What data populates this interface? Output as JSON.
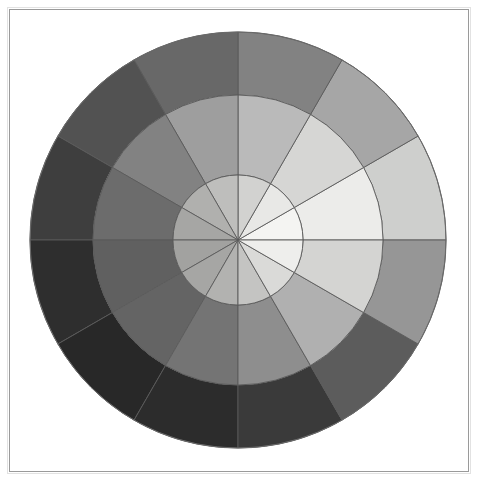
{
  "page": {
    "background_color": "#ffffff"
  },
  "frame": {
    "name": "picture-frame",
    "border_color": "#9a9a9a",
    "outer_border_color": "#e2e2e2",
    "inset_px": 9
  },
  "chart_data": {
    "type": "pie",
    "subtitle": "12 hue sectors × 3 concentric value rings",
    "xlabel": "",
    "ylabel": "",
    "legend_position": "none",
    "grid": false,
    "center": {
      "x": 238,
      "y": 240
    },
    "sector_count": 12,
    "sector_angle_degrees": 30,
    "start_angle_degrees": 0,
    "ring_count": 3,
    "ring_names": [
      "inner",
      "middle",
      "outer"
    ],
    "radii": {
      "inner": 65,
      "middle": 145,
      "outer": 208
    },
    "stroke_color": "#5a5a5a",
    "categories": [
      "0°–30°",
      "30°–60°",
      "60°–90°",
      "90°–120°",
      "120°–150°",
      "150°–180°",
      "180°–210°",
      "210°–240°",
      "240°–270°",
      "270°–300°",
      "300°–330°",
      "330°–360°"
    ],
    "series": [
      {
        "name": "inner",
        "values": [
          244,
          232,
          210,
          190,
          176,
          166,
          162,
          166,
          178,
          196,
          218,
          238
        ],
        "colors": [
          "#f4f4f2",
          "#e8e8e6",
          "#d2d2d0",
          "#bebebc",
          "#b0b0ae",
          "#a6a6a4",
          "#a2a2a0",
          "#a6a6a4",
          "#b2b2b0",
          "#c4c4c2",
          "#dadad8",
          "#eeeeec"
        ]
      },
      {
        "name": "middle",
        "values": [
          236,
          214,
          186,
          158,
          130,
          108,
          96,
          100,
          116,
          142,
          176,
          212
        ],
        "colors": [
          "#ececea",
          "#d6d6d4",
          "#bababa",
          "#9e9e9e",
          "#828282",
          "#6c6c6c",
          "#606060",
          "#646464",
          "#747474",
          "#8e8e8e",
          "#b0b0b0",
          "#d4d4d2"
        ]
      },
      {
        "name": "outer",
        "values": [
          206,
          166,
          130,
          104,
          82,
          62,
          46,
          40,
          44,
          58,
          92,
          150
        ],
        "colors": [
          "#cecfcd",
          "#a6a6a6",
          "#828282",
          "#686868",
          "#525252",
          "#3e3e3e",
          "#2e2e2e",
          "#282828",
          "#2c2c2c",
          "#3a3a3a",
          "#5c5c5c",
          "#969696"
        ]
      }
    ],
    "annotations": [
      "Lightest sector lies on the right side, just above the horizontal axis.",
      "Darkest sectors lie on the lower-left, below the horizontal axis.",
      "Lightness decreases outward from the centre in every sector.",
      "Sector boundary lines are drawn in mid-gray."
    ]
  }
}
